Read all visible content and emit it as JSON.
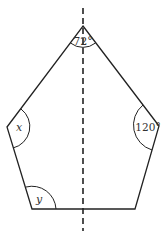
{
  "figure": {
    "type": "pentagon-with-symmetry-axis",
    "vertices": {
      "top": [
        83,
        26
      ],
      "right": [
        159,
        126
      ],
      "bottom_right": [
        135,
        209
      ],
      "bottom_left": [
        32,
        209
      ],
      "left": [
        7,
        127
      ]
    },
    "axis_of_symmetry": {
      "x": 83,
      "y1": 8,
      "y2": 231,
      "style": "dashed"
    },
    "angle_labels": {
      "top": "72°",
      "right": "120°",
      "left": "x",
      "bottom_left": "y"
    },
    "colors": {
      "stroke": "#222222",
      "label": "#333333",
      "background": "#ffffff"
    }
  }
}
